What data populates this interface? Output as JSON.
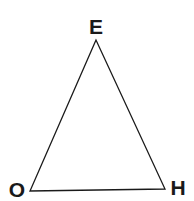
{
  "diagram": {
    "type": "triangle",
    "stroke_color": "#1a1a1a",
    "background": "#ffffff",
    "vertices": [
      {
        "label": "E",
        "x": 96,
        "y": 40,
        "label_x": 96,
        "label_y": 34
      },
      {
        "label": "O",
        "x": 30,
        "y": 191,
        "label_x": 17,
        "label_y": 197
      },
      {
        "label": "H",
        "x": 165,
        "y": 189,
        "label_x": 178,
        "label_y": 195
      }
    ]
  }
}
